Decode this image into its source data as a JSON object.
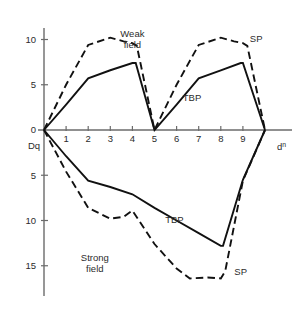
{
  "chart_data": {
    "type": "line",
    "title": "",
    "xlabel": "d n",
    "ylabel": "Dq",
    "xlim": [
      0,
      10
    ],
    "ylim": [
      -17.5,
      11
    ],
    "grid": false,
    "legend": "annotations",
    "x_ticks": [
      "1",
      "2",
      "3",
      "4",
      "5",
      "6",
      "7",
      "8",
      "9"
    ],
    "x_tick_values": [
      1,
      2,
      3,
      4,
      5,
      6,
      7,
      8,
      9
    ],
    "y_ticks": [
      "10",
      "5",
      "0",
      "5",
      "10",
      "15"
    ],
    "y_tick_values": [
      10,
      5,
      0,
      -5,
      -10,
      -15
    ],
    "annotations": [
      {
        "id": "weak-field",
        "text_line1": "Weak",
        "text_line2": "field",
        "x": 4.0,
        "y": 10.3
      },
      {
        "id": "strong-field",
        "text_line1": "Strong",
        "text_line2": "field",
        "x": 2.3,
        "y": -14.5
      },
      {
        "id": "sp-upper",
        "text": "SP",
        "x": 9.6,
        "y": 9.7
      },
      {
        "id": "tbp-upper",
        "text": "TBP",
        "x": 6.7,
        "y": 3.2
      },
      {
        "id": "tbp-lower",
        "text": "TBP",
        "x": 5.9,
        "y": -10.3
      },
      {
        "id": "sp-lower",
        "text": "SP",
        "x": 8.9,
        "y": -16.0
      }
    ],
    "series": [
      {
        "name": "Weak field TBP",
        "style": "solid",
        "region": "weak",
        "x": [
          0,
          1,
          2,
          3,
          4,
          4.15,
          5,
          6,
          7,
          8,
          8.9,
          9.0,
          10
        ],
        "y": [
          0,
          2.8,
          5.7,
          6.6,
          7.4,
          7.4,
          0,
          2.8,
          5.7,
          6.6,
          7.4,
          7.4,
          0
        ]
      },
      {
        "name": "Weak field SP",
        "style": "dashed",
        "region": "weak",
        "x": [
          0,
          1,
          2,
          3,
          3.6,
          4,
          4.2,
          5,
          6,
          7,
          8,
          8.6,
          9,
          9.2,
          10
        ],
        "y": [
          0,
          5.0,
          9.4,
          10.2,
          9.8,
          9.6,
          9.3,
          0,
          5.0,
          9.4,
          10.2,
          9.8,
          9.6,
          9.3,
          0
        ]
      },
      {
        "name": "Strong field TBP",
        "style": "solid",
        "region": "strong",
        "x": [
          0,
          1,
          2,
          3,
          4,
          5,
          6,
          7,
          8,
          8.1,
          9,
          10
        ],
        "y": [
          0,
          -2.9,
          -5.6,
          -6.3,
          -7.1,
          -8.6,
          -10.0,
          -11.4,
          -12.8,
          -12.8,
          -5.5,
          0
        ]
      },
      {
        "name": "Strong field SP",
        "style": "dashed",
        "region": "strong",
        "x": [
          0,
          1,
          2,
          3,
          3.6,
          4,
          4.3,
          5,
          6,
          6.6,
          7.4,
          8,
          8.2,
          9,
          10
        ],
        "y": [
          0,
          -4.6,
          -8.6,
          -9.8,
          -9.6,
          -8.9,
          -10.0,
          -12.6,
          -15.3,
          -16.4,
          -16.3,
          -16.4,
          -15.6,
          -5.6,
          0
        ]
      }
    ]
  }
}
